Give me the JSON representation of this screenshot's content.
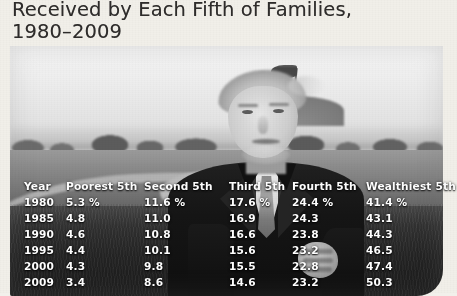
{
  "heading": {
    "text": "Received by Each Fifth of Families,\n1980–2009"
  },
  "photo": {
    "description": "Black and white photograph of a man in a dark suit, white shirt and patterned tie standing on a golf course with hands clasped, a golf flag on a green behind him",
    "subject": "man-in-suit-on-golf-course",
    "flag": "golf-flag"
  },
  "table": {
    "headers": [
      "Year",
      "Poorest 5th",
      "Second 5th",
      "Third 5th",
      "Fourth 5th",
      "Wealthiest 5th"
    ],
    "rows": [
      [
        "1980",
        "5.3 %",
        "11.6 %",
        "17.6 %",
        "24.4 %",
        "41.4 %"
      ],
      [
        "1985",
        "4.8",
        "11.0",
        "16.9",
        "24.3",
        "43.1"
      ],
      [
        "1990",
        "4.6",
        "10.8",
        "16.6",
        "23.8",
        "44.3"
      ],
      [
        "1995",
        "4.4",
        "10.1",
        "15.6",
        "23.2",
        "46.5"
      ],
      [
        "2000",
        "4.3",
        "9.8",
        "15.5",
        "22.8",
        "47.4"
      ],
      [
        "2009",
        "3.4",
        "8.6",
        "14.6",
        "23.2",
        "50.3"
      ]
    ]
  },
  "colors": {
    "page_background": "#f1efe9",
    "heading_text": "#2e2c2b",
    "table_text": "#ffffff",
    "table_backdrop": "#2b2926"
  }
}
